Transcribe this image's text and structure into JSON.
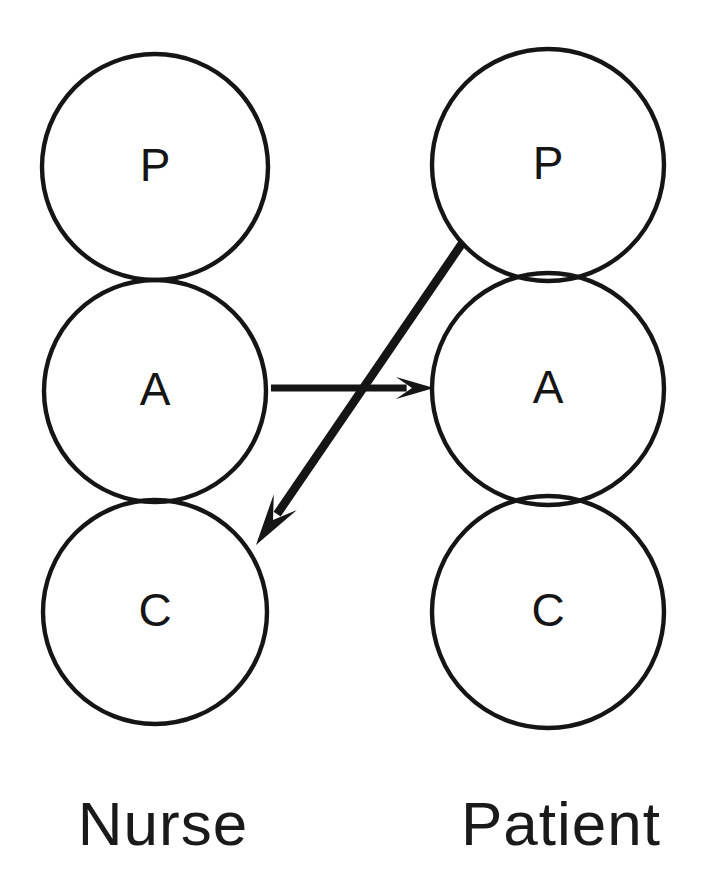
{
  "figure": {
    "type": "transactional-analysis-diagram",
    "background_color": "#ffffff",
    "line_color": "#151515",
    "width": 703,
    "height": 880
  },
  "columns": [
    {
      "id": "nurse",
      "label": "Nurse",
      "label_x": 163,
      "label_y": 845,
      "center_x": 155,
      "ego_states": [
        {
          "letter": "P",
          "name": "parent",
          "cy": 167,
          "r": 113
        },
        {
          "letter": "A",
          "name": "adult",
          "cy": 391,
          "r": 111
        },
        {
          "letter": "C",
          "name": "child",
          "cy": 612,
          "r": 112
        }
      ]
    },
    {
      "id": "patient",
      "label": "Patient",
      "label_x": 561,
      "label_y": 845,
      "center_x": 548,
      "ego_states": [
        {
          "letter": "P",
          "name": "parent",
          "cy": 165,
          "r": 116
        },
        {
          "letter": "A",
          "name": "adult",
          "cy": 389,
          "r": 116
        },
        {
          "letter": "C",
          "name": "child",
          "cy": 612,
          "r": 116
        }
      ]
    }
  ],
  "transactions": [
    {
      "id": "complementary-adult-adult",
      "name": "nurse-adult-to-patient-adult-arrow",
      "from": "Nurse Adult",
      "to": "Patient Adult",
      "x1": 271,
      "y1": 388,
      "x2": 434,
      "y2": 388,
      "stroke_width": 7,
      "head_length": 38,
      "head_width": 22
    },
    {
      "id": "crossed-parent-child",
      "name": "patient-parent-to-nurse-child-arrow",
      "from": "Patient Parent",
      "to": "Nurse Child",
      "x1": 463,
      "y1": 242,
      "x2": 256,
      "y2": 545,
      "stroke_width": 8.5,
      "head_length": 52,
      "head_width": 28
    }
  ]
}
